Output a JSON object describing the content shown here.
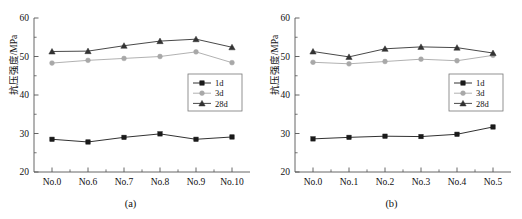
{
  "figure": {
    "panels": [
      {
        "caption": "(a)",
        "ylabel": "抗压强度/MPa",
        "xlabel": "",
        "chart_data": {
          "type": "line",
          "title": "",
          "xlabel": "",
          "ylabel": "抗压强度/MPa",
          "categories": [
            "No.0",
            "No.6",
            "No.7",
            "No.8",
            "No.9",
            "No.10"
          ],
          "ylim": [
            20,
            60
          ],
          "yticks": [
            20,
            30,
            40,
            50,
            60
          ],
          "grid": false,
          "legend_position": "center-right",
          "series": [
            {
              "name": "1d",
              "marker": "square",
              "color": "#1a1a1a",
              "values": [
                28.5,
                27.8,
                29.0,
                29.9,
                28.5,
                29.1
              ]
            },
            {
              "name": "3d",
              "marker": "circle",
              "color": "#a8a8a8",
              "values": [
                48.3,
                49.0,
                49.5,
                50.0,
                51.2,
                48.4
              ]
            },
            {
              "name": "28d",
              "marker": "triangle",
              "color": "#333333",
              "values": [
                51.3,
                51.4,
                52.8,
                54.0,
                54.5,
                52.4
              ]
            }
          ]
        }
      },
      {
        "caption": "(b)",
        "ylabel": "抗压强度/MPa",
        "xlabel": "",
        "chart_data": {
          "type": "line",
          "title": "",
          "xlabel": "",
          "ylabel": "抗压强度/MPa",
          "categories": [
            "No.0",
            "No.1",
            "No.2",
            "No.3",
            "No.4",
            "No.5"
          ],
          "ylim": [
            20,
            60
          ],
          "yticks": [
            20,
            30,
            40,
            50,
            60
          ],
          "grid": false,
          "legend_position": "center-right",
          "series": [
            {
              "name": "1d",
              "marker": "square",
              "color": "#1a1a1a",
              "values": [
                28.6,
                29.0,
                29.3,
                29.2,
                29.8,
                31.7
              ]
            },
            {
              "name": "3d",
              "marker": "circle",
              "color": "#a8a8a8",
              "values": [
                48.5,
                48.1,
                48.7,
                49.3,
                48.9,
                50.3
              ]
            },
            {
              "name": "28d",
              "marker": "triangle",
              "color": "#333333",
              "values": [
                51.3,
                49.9,
                52.0,
                52.5,
                52.3,
                50.9
              ]
            }
          ]
        }
      }
    ]
  }
}
